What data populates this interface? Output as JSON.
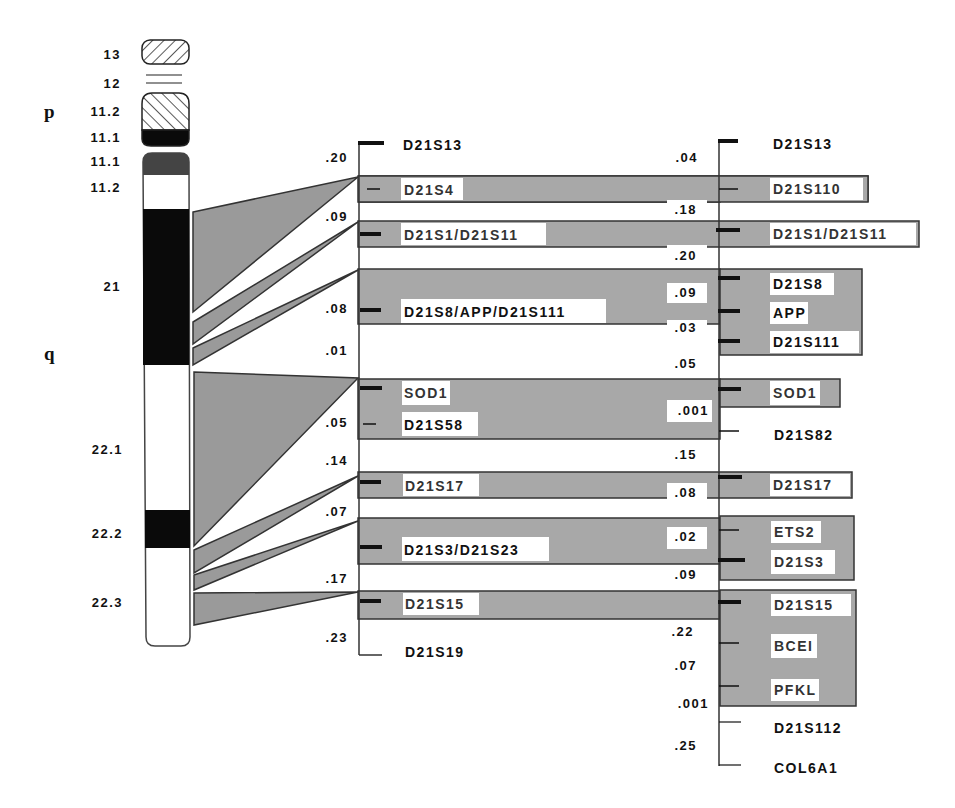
{
  "title_fragment": "...pping...",
  "ideogram": {
    "arms": {
      "p": "p",
      "q": "q"
    },
    "bands": [
      {
        "name": "13",
        "y": 52,
        "h": 22,
        "fill": "hatch-back"
      },
      {
        "name": "12",
        "y": 80,
        "h": 10,
        "fill": "lines"
      },
      {
        "name": "11.2",
        "y": 95,
        "h": 35,
        "fill": "hatch-fwd"
      },
      {
        "name": "11.1",
        "y": 130,
        "h": 14,
        "fill": "black"
      },
      {
        "name": "11.1",
        "y": 154,
        "h": 20,
        "fill": "darkgrey"
      },
      {
        "name": "11.2",
        "y": 174,
        "h": 36,
        "fill": "white"
      },
      {
        "name": "21",
        "y": 210,
        "h": 155,
        "fill": "black"
      },
      {
        "name": "22.1",
        "y": 365,
        "h": 145,
        "fill": "white"
      },
      {
        "name": "22.2",
        "y": 510,
        "h": 38,
        "fill": "black"
      },
      {
        "name": "22.3",
        "y": 548,
        "h": 98,
        "fill": "white"
      }
    ],
    "band_labels": [
      {
        "text": "13",
        "y": 58
      },
      {
        "text": "12",
        "y": 85
      },
      {
        "text": "11.2",
        "y": 113
      },
      {
        "text": "11.1",
        "y": 140
      },
      {
        "text": "11.1",
        "y": 164
      },
      {
        "text": "11.2",
        "y": 190
      },
      {
        "text": "21",
        "y": 287
      },
      {
        "text": "22.1",
        "y": 450
      },
      {
        "text": "22.2",
        "y": 535
      },
      {
        "text": "22.3",
        "y": 603
      }
    ]
  },
  "middle_map": {
    "top_marker": "D21S13",
    "bottom_marker": "D21S19",
    "markers": [
      {
        "id": "D21S13",
        "label": "D21S13"
      },
      {
        "id": "D21S4",
        "label": "D21S4"
      },
      {
        "id": "D21S1_D21S11",
        "label": "D21S1/D21S11"
      },
      {
        "id": "D21S8_APP_D21S111",
        "label": "D21S8/APP/D21S111"
      },
      {
        "id": "SOD1",
        "label": "SOD1"
      },
      {
        "id": "D21S58",
        "label": "D21S58"
      },
      {
        "id": "D21S17",
        "label": "D21S17"
      },
      {
        "id": "D21S3_D21S23",
        "label": "D21S3/D21S23"
      },
      {
        "id": "D21S15",
        "label": "D21S15"
      },
      {
        "id": "D21S19",
        "label": "D21S19"
      }
    ],
    "distances": [
      {
        "text": ".20",
        "y": 160
      },
      {
        "text": ".09",
        "y": 220
      },
      {
        "text": ".08",
        "y": 310
      },
      {
        "text": ".01",
        "y": 352
      },
      {
        "text": ".05",
        "y": 425
      },
      {
        "text": ".14",
        "y": 463
      },
      {
        "text": ".07",
        "y": 515
      },
      {
        "text": ".17",
        "y": 580
      },
      {
        "text": ".23",
        "y": 640
      }
    ]
  },
  "right_map": {
    "markers": [
      {
        "id": "D21S13",
        "label": "D21S13"
      },
      {
        "id": "D21S110",
        "label": "D21S110"
      },
      {
        "id": "D21S1_D21S11",
        "label": "D21S1/D21S11"
      },
      {
        "id": "D21S8",
        "label": "D21S8"
      },
      {
        "id": "APP",
        "label": "APP"
      },
      {
        "id": "D21S111",
        "label": "D21S111"
      },
      {
        "id": "SOD1",
        "label": "SOD1"
      },
      {
        "id": "D21S82",
        "label": "D21S82"
      },
      {
        "id": "D21S17",
        "label": "D21S17"
      },
      {
        "id": "ETS2",
        "label": "ETS2"
      },
      {
        "id": "D21S3",
        "label": "D21S3"
      },
      {
        "id": "D21S15",
        "label": "D21S15"
      },
      {
        "id": "BCEI",
        "label": "BCEI"
      },
      {
        "id": "PFKL",
        "label": "PFKL"
      },
      {
        "id": "D21S112",
        "label": "D21S112"
      },
      {
        "id": "COL6A1",
        "label": "COL6A1"
      }
    ],
    "distances": [
      {
        "text": ".04",
        "y": 160
      },
      {
        "text": ".18",
        "y": 212
      },
      {
        "text": ".20",
        "y": 260
      },
      {
        "text": ".09",
        "y": 296
      },
      {
        "text": ".03",
        "y": 330
      },
      {
        "text": ".05",
        "y": 367
      },
      {
        "text": ".001",
        "y": 414
      },
      {
        "text": ".15",
        "y": 458
      },
      {
        "text": ".08",
        "y": 496
      },
      {
        "text": ".02",
        "y": 541
      },
      {
        "text": ".09",
        "y": 578
      },
      {
        "text": ".22",
        "y": 634
      },
      {
        "text": ".07",
        "y": 668
      },
      {
        "text": ".001",
        "y": 706
      },
      {
        "text": ".25",
        "y": 748
      }
    ]
  },
  "colors": {
    "band_grey": "#a8a8a8",
    "connector_grey": "#9a9a9a",
    "line": "#333333",
    "black": "#0a0a0a",
    "label_bg": "#ffffff"
  }
}
